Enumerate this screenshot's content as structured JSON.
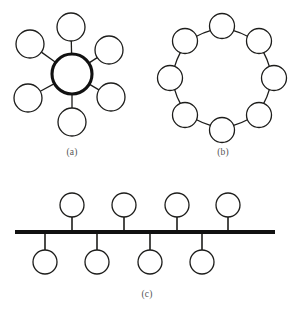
{
  "figure": {
    "background_color": "#ffffff",
    "line_color": "#1d1d1b",
    "hub_color": "#111111",
    "caption_color": "#555555",
    "panels": [
      {
        "id": "panel-a",
        "caption": "(a)",
        "topology": "star",
        "caption_x": 72,
        "caption_y": 155,
        "hub": {
          "label": "central hub node",
          "cx": 72,
          "cy": 74,
          "r": 20,
          "stroke_width": 3.1
        },
        "node_radius": 14,
        "nodes": [
          {
            "label": "star-node-top",
            "cx": 71,
            "cy": 27
          },
          {
            "label": "star-node-upper-left",
            "cx": 30,
            "cy": 44
          },
          {
            "label": "star-node-upper-right",
            "cx": 109,
            "cy": 50
          },
          {
            "label": "star-node-lower-left",
            "cx": 28,
            "cy": 98
          },
          {
            "label": "star-node-lower-right",
            "cx": 111,
            "cy": 97
          },
          {
            "label": "star-node-bottom",
            "cx": 72,
            "cy": 122
          }
        ]
      },
      {
        "id": "panel-b",
        "caption": "(b)",
        "topology": "ring",
        "caption_x": 223,
        "caption_y": 155,
        "ring_center_x": 222,
        "ring_center_y": 78,
        "ring_radius": 52,
        "node_radius": 12.5,
        "node_count": 8,
        "nodes": [
          {
            "label": "ring-node-1",
            "cx": 222,
            "cy": 26
          },
          {
            "label": "ring-node-2",
            "cx": 259,
            "cy": 41
          },
          {
            "label": "ring-node-3",
            "cx": 274,
            "cy": 78
          },
          {
            "label": "ring-node-4",
            "cx": 259,
            "cy": 115
          },
          {
            "label": "ring-node-5",
            "cx": 222,
            "cy": 130
          },
          {
            "label": "ring-node-6",
            "cx": 185,
            "cy": 115
          },
          {
            "label": "ring-node-7",
            "cx": 170,
            "cy": 78
          },
          {
            "label": "ring-node-8",
            "cx": 185,
            "cy": 41
          }
        ]
      },
      {
        "id": "panel-c",
        "caption": "(c)",
        "topology": "bus",
        "caption_x": 147,
        "caption_y": 297,
        "backbone": {
          "label": "bus-backbone-line",
          "x1": 15,
          "x2": 275,
          "y": 232,
          "stroke_width": 4.2
        },
        "node_radius": 12,
        "nodes_above": [
          {
            "label": "bus-node-top-1",
            "cx": 72,
            "cy": 205
          },
          {
            "label": "bus-node-top-2",
            "cx": 124,
            "cy": 205
          },
          {
            "label": "bus-node-top-3",
            "cx": 177,
            "cy": 205
          },
          {
            "label": "bus-node-top-4",
            "cx": 228,
            "cy": 205
          }
        ],
        "nodes_below": [
          {
            "label": "bus-node-bottom-1",
            "cx": 45,
            "cy": 262
          },
          {
            "label": "bus-node-bottom-2",
            "cx": 97,
            "cy": 262
          },
          {
            "label": "bus-node-bottom-3",
            "cx": 150,
            "cy": 262
          },
          {
            "label": "bus-node-bottom-4",
            "cx": 202,
            "cy": 262
          }
        ]
      }
    ]
  }
}
